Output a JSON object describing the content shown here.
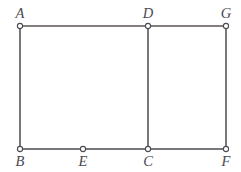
{
  "figure": {
    "kind": "geometry-diagram",
    "width": 241,
    "height": 172,
    "background_color": "#ffffff",
    "stroke_color": "#4a4a52",
    "top_edge_color": "#5a5250",
    "marker_fill_color": "#ffffff",
    "marker_stroke_color": "#4a4a52",
    "label_color": "#4a4a52",
    "points": [
      {
        "id": "A",
        "label": "A",
        "x": 20,
        "y": 26,
        "label_x": 20,
        "label_y": 18,
        "label_anchor": "middle",
        "marker": "open-circle",
        "marker_r": 2.6
      },
      {
        "id": "D",
        "label": "D",
        "x": 148,
        "y": 26,
        "label_x": 148,
        "label_y": 18,
        "label_anchor": "middle",
        "marker": "open-circle",
        "marker_r": 2.6
      },
      {
        "id": "G",
        "label": "G",
        "x": 226,
        "y": 26,
        "label_x": 226,
        "label_y": 18,
        "label_anchor": "middle",
        "marker": "open-circle",
        "marker_r": 2.6
      },
      {
        "id": "B",
        "label": "B",
        "x": 20,
        "y": 149,
        "label_x": 20,
        "label_y": 166,
        "label_anchor": "middle",
        "marker": "open-circle",
        "marker_r": 2.6
      },
      {
        "id": "E",
        "label": "E",
        "x": 83,
        "y": 149,
        "label_x": 83,
        "label_y": 166,
        "label_anchor": "middle",
        "marker": "open-circle",
        "marker_r": 2.6
      },
      {
        "id": "C",
        "label": "C",
        "x": 148,
        "y": 149,
        "label_x": 148,
        "label_y": 166,
        "label_anchor": "middle",
        "marker": "open-circle",
        "marker_r": 2.6
      },
      {
        "id": "F",
        "label": "F",
        "x": 226,
        "y": 149,
        "label_x": 226,
        "label_y": 166,
        "label_anchor": "middle",
        "marker": "open-circle",
        "marker_r": 2.6
      }
    ],
    "segments": [
      {
        "id": "AG",
        "from": "A",
        "to": "G",
        "x1": 20,
        "y1": 26,
        "x2": 226,
        "y2": 26,
        "color": "#5a5250",
        "width": 1.5
      },
      {
        "id": "BF",
        "from": "B",
        "to": "F",
        "x1": 20,
        "y1": 149,
        "x2": 226,
        "y2": 149,
        "color": "#4a4a52",
        "width": 1.5
      },
      {
        "id": "AB",
        "from": "A",
        "to": "B",
        "x1": 20,
        "y1": 26,
        "x2": 20,
        "y2": 149,
        "color": "#4a4a52",
        "width": 1.5
      },
      {
        "id": "DC",
        "from": "D",
        "to": "C",
        "x1": 148,
        "y1": 26,
        "x2": 148,
        "y2": 149,
        "color": "#4a4a52",
        "width": 1.5
      },
      {
        "id": "GF",
        "from": "G",
        "to": "F",
        "x1": 226,
        "y1": 26,
        "x2": 226,
        "y2": 149,
        "color": "#4a4a52",
        "width": 1.5
      }
    ]
  }
}
